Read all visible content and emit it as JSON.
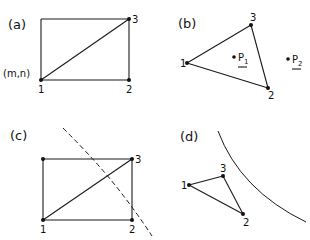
{
  "figure": {
    "panels": [
      {
        "id": "a",
        "label": "(a)",
        "shape": "rectangle-with-diagonal",
        "corner_label": "(m,n)",
        "nodes": [
          {
            "id": "1",
            "label": "1"
          },
          {
            "id": "2",
            "label": "2"
          },
          {
            "id": "3",
            "label": "3"
          }
        ],
        "edges": [
          [
            "1",
            "2"
          ],
          [
            "2",
            "3"
          ],
          [
            "1",
            "3"
          ]
        ]
      },
      {
        "id": "b",
        "label": "(b)",
        "shape": "triangle",
        "nodes": [
          {
            "id": "1",
            "label": "1"
          },
          {
            "id": "2",
            "label": "2"
          },
          {
            "id": "3",
            "label": "3"
          }
        ],
        "edges": [
          [
            "1",
            "2"
          ],
          [
            "2",
            "3"
          ],
          [
            "1",
            "3"
          ]
        ],
        "points": [
          {
            "id": "P1",
            "label": "P",
            "subscript": "1",
            "location": "inside triangle"
          },
          {
            "id": "P2",
            "label": "P",
            "subscript": "2",
            "location": "outside triangle"
          }
        ]
      },
      {
        "id": "c",
        "label": "(c)",
        "shape": "rectangle-with-diagonal",
        "nodes": [
          {
            "id": "1",
            "label": "1"
          },
          {
            "id": "2",
            "label": "2"
          },
          {
            "id": "3",
            "label": "3"
          }
        ],
        "edges": [
          [
            "1",
            "2"
          ],
          [
            "2",
            "3"
          ],
          [
            "1",
            "3"
          ]
        ],
        "boundary": "dashed curve crossing rectangle"
      },
      {
        "id": "d",
        "label": "(d)",
        "shape": "triangle",
        "nodes": [
          {
            "id": "1",
            "label": "1"
          },
          {
            "id": "2",
            "label": "2"
          },
          {
            "id": "3",
            "label": "3"
          }
        ],
        "edges": [
          [
            "1",
            "2"
          ],
          [
            "2",
            "3"
          ],
          [
            "1",
            "3"
          ]
        ],
        "boundary": "solid curve outside triangle"
      }
    ]
  }
}
